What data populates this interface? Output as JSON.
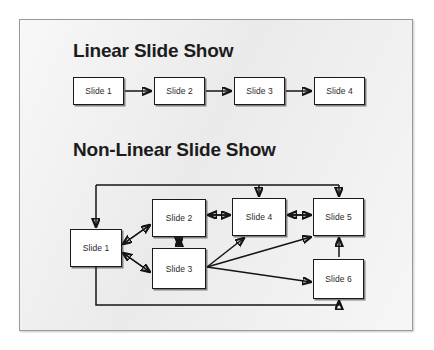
{
  "slide": {
    "background_color": "#efefef",
    "border_color": "#9a9a9a",
    "page_background": "#ffffff",
    "line_color": "#141414",
    "node_fill": "#ffffff",
    "node_border": "#1a1a1a",
    "text_color": "#1c1c1c"
  },
  "sections": {
    "linear": {
      "title": "Linear Slide Show",
      "nodes": [
        {
          "id": "l1",
          "label": "Slide 1",
          "x": 53,
          "y": 57,
          "w": 51,
          "h": 28
        },
        {
          "id": "l2",
          "label": "Slide 2",
          "x": 134,
          "y": 57,
          "w": 51,
          "h": 28
        },
        {
          "id": "l3",
          "label": "Slide 3",
          "x": 214,
          "y": 57,
          "w": 51,
          "h": 28
        },
        {
          "id": "l4",
          "label": "Slide 4",
          "x": 294,
          "y": 57,
          "w": 51,
          "h": 28
        }
      ],
      "connections": [
        {
          "from": "Slide 1",
          "to": "Slide 2",
          "type": "arrow"
        },
        {
          "from": "Slide 2",
          "to": "Slide 3",
          "type": "arrow"
        },
        {
          "from": "Slide 3",
          "to": "Slide 4",
          "type": "arrow"
        }
      ]
    },
    "nonlinear": {
      "title": "Non-Linear Slide Show",
      "nodes": [
        {
          "id": "n1",
          "label": "Slide 1",
          "x": 50,
          "y": 209,
          "w": 52,
          "h": 38
        },
        {
          "id": "n2",
          "label": "Slide 2",
          "x": 132,
          "y": 179,
          "w": 54,
          "h": 38
        },
        {
          "id": "n3",
          "label": "Slide 3",
          "x": 132,
          "y": 228,
          "w": 54,
          "h": 41
        },
        {
          "id": "n4",
          "label": "Slide 4",
          "x": 212,
          "y": 178,
          "w": 54,
          "h": 38
        },
        {
          "id": "n5",
          "label": "Slide 5",
          "x": 293,
          "y": 178,
          "w": 51,
          "h": 38
        },
        {
          "id": "n6",
          "label": "Slide 6",
          "x": 293,
          "y": 239,
          "w": 51,
          "h": 40
        }
      ],
      "connections": [
        {
          "from": "Slide 1",
          "to": "Slide 2",
          "type": "double-arrow"
        },
        {
          "from": "Slide 1",
          "to": "Slide 3",
          "type": "double-arrow"
        },
        {
          "from": "Slide 2",
          "to": "Slide 3",
          "type": "double-arrow"
        },
        {
          "from": "Slide 2",
          "to": "Slide 4",
          "type": "double-arrow"
        },
        {
          "from": "Slide 4",
          "to": "Slide 5",
          "type": "double-arrow"
        },
        {
          "from": "Slide 3",
          "to": "Slide 4",
          "type": "arrow"
        },
        {
          "from": "Slide 3",
          "to": "Slide 5",
          "type": "arrow"
        },
        {
          "from": "Slide 3",
          "to": "Slide 6",
          "type": "arrow"
        },
        {
          "from": "Slide 6",
          "to": "Slide 5",
          "type": "arrow"
        },
        {
          "from": "loop-top",
          "to": "Slide 4",
          "type": "arrow"
        },
        {
          "from": "loop-top",
          "to": "Slide 5",
          "type": "arrow"
        },
        {
          "from": "loop-left",
          "to": "Slide 1",
          "type": "arrow"
        },
        {
          "from": "Slide 1",
          "to": "loop-bottom",
          "type": "line"
        },
        {
          "from": "Slide 6",
          "to": "loop-bottom",
          "type": "line"
        }
      ]
    }
  }
}
